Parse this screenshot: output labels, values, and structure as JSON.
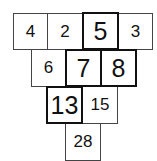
{
  "rows": [
    [
      {
        "value": "4",
        "emphasized": false
      },
      {
        "value": "2",
        "emphasized": false
      },
      {
        "value": "5",
        "emphasized": true
      },
      {
        "value": "3",
        "emphasized": false
      }
    ],
    [
      {
        "value": "6",
        "emphasized": false
      },
      {
        "value": "7",
        "emphasized": true
      },
      {
        "value": "8",
        "emphasized": true
      }
    ],
    [
      {
        "value": "13",
        "emphasized": true
      },
      {
        "value": "15",
        "emphasized": false
      }
    ],
    [
      {
        "value": "28",
        "emphasized": false
      }
    ]
  ]
}
